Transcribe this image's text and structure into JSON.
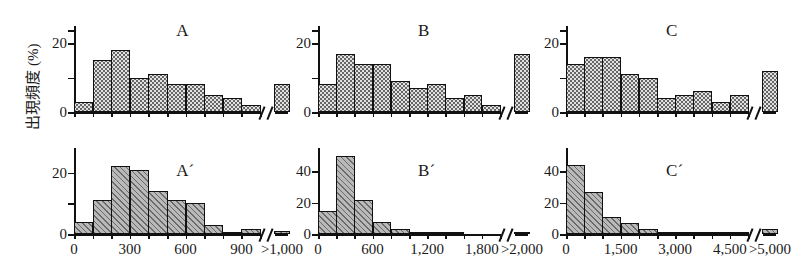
{
  "figure": {
    "ylabel": "出現頻度 (%)",
    "break_symbol": "//"
  },
  "chart_data": [
    {
      "type": "bar",
      "title": "A",
      "panel_id": "A",
      "xlabel": "",
      "ylabel": "出現頻度 (%)",
      "ylim": [
        0,
        25
      ],
      "yticks": [
        0,
        10,
        20
      ],
      "ytick_labels": [
        "0",
        "",
        "20"
      ],
      "xticks": [
        0,
        300,
        600,
        900
      ],
      "xtick_labels": [
        "0",
        "300",
        "600",
        "900"
      ],
      "overflow_label": ">1,000",
      "grid": false,
      "axis_break": true,
      "bin_width": 100,
      "categories": [
        "0-100",
        "100-200",
        "200-300",
        "300-400",
        "400-500",
        "500-600",
        "600-700",
        "700-800",
        "800-900",
        "900-1000",
        ">1,000"
      ],
      "values": [
        3,
        15,
        18,
        10,
        11,
        8,
        8,
        5,
        4,
        2,
        8
      ]
    },
    {
      "type": "bar",
      "title": "A´",
      "panel_id": "A-prime",
      "xlabel": "",
      "ylabel": "出現頻度 (%)",
      "ylim": [
        0,
        28
      ],
      "yticks": [
        0,
        10,
        20
      ],
      "ytick_labels": [
        "0",
        "",
        "20"
      ],
      "xticks": [
        0,
        300,
        600,
        900
      ],
      "xtick_labels": [
        "0",
        "300",
        "600",
        "900"
      ],
      "overflow_label": ">1,000",
      "grid": false,
      "axis_break": true,
      "bin_width": 100,
      "categories": [
        "0-100",
        "100-200",
        "200-300",
        "300-400",
        "400-500",
        "500-600",
        "600-700",
        "700-800",
        "800-900",
        "900-1000",
        ">1,000"
      ],
      "values": [
        4,
        11,
        22,
        21,
        14,
        11,
        10,
        3,
        0.5,
        1.5,
        1
      ]
    },
    {
      "type": "bar",
      "title": "B",
      "panel_id": "B",
      "xlabel": "",
      "ylabel": "出現頻度 (%)",
      "ylim": [
        0,
        25
      ],
      "yticks": [
        0,
        10,
        20
      ],
      "ytick_labels": [
        "0",
        "",
        "20"
      ],
      "xticks": [
        0,
        600,
        1200,
        1800
      ],
      "xtick_labels": [
        "0",
        "600",
        "1,200",
        "1,800"
      ],
      "overflow_label": ">2,000",
      "grid": false,
      "axis_break": true,
      "bin_width": 200,
      "categories": [
        "0-200",
        "200-400",
        "400-600",
        "600-800",
        "800-1000",
        "1000-1200",
        "1200-1400",
        "1400-1600",
        "1600-1800",
        "1800-2000",
        ">2,000"
      ],
      "values": [
        8,
        17,
        14,
        14,
        9,
        7,
        8,
        4,
        5,
        2,
        17
      ]
    },
    {
      "type": "bar",
      "title": "B´",
      "panel_id": "B-prime",
      "xlabel": "",
      "ylabel": "出現頻度 (%)",
      "ylim": [
        0,
        55
      ],
      "yticks": [
        0,
        20,
        40
      ],
      "ytick_labels": [
        "0",
        "20",
        "40"
      ],
      "xticks": [
        0,
        600,
        1200,
        1800
      ],
      "xtick_labels": [
        "0",
        "600",
        "1,200",
        "1,800"
      ],
      "overflow_label": ">2,000",
      "grid": false,
      "axis_break": true,
      "bin_width": 200,
      "categories": [
        "0-200",
        "200-400",
        "400-600",
        "600-800",
        "800-1000",
        "1000-1200",
        "1200-1400",
        "1400-1600",
        "1600-1800",
        "1800-2000",
        ">2,000"
      ],
      "values": [
        15,
        50,
        22,
        8,
        3,
        1.5,
        1.5,
        0.8,
        0,
        0,
        1
      ]
    },
    {
      "type": "bar",
      "title": "C",
      "panel_id": "C",
      "xlabel": "",
      "ylabel": "出現頻度 (%)",
      "ylim": [
        0,
        25
      ],
      "yticks": [
        0,
        10,
        20
      ],
      "ytick_labels": [
        "0",
        "",
        "20"
      ],
      "xticks": [
        0,
        1500,
        3000,
        4500
      ],
      "xtick_labels": [
        "0",
        "1,500",
        "3,000",
        "4,500"
      ],
      "overflow_label": ">5,000",
      "grid": false,
      "axis_break": true,
      "bin_width": 500,
      "categories": [
        "0-500",
        "500-1000",
        "1000-1500",
        "1500-2000",
        "2000-2500",
        "2500-3000",
        "3000-3500",
        "3500-4000",
        "4000-4500",
        "4500-5000",
        ">5,000"
      ],
      "values": [
        14,
        16,
        16,
        11,
        10,
        4,
        5,
        6,
        3,
        5,
        12
      ]
    },
    {
      "type": "bar",
      "title": "C´",
      "panel_id": "C-prime",
      "xlabel": "",
      "ylabel": "出現頻度 (%)",
      "ylim": [
        0,
        55
      ],
      "yticks": [
        0,
        20,
        40
      ],
      "ytick_labels": [
        "0",
        "20",
        "40"
      ],
      "xticks": [
        0,
        1500,
        3000,
        4500
      ],
      "xtick_labels": [
        "0",
        "1,500",
        "3,000",
        "4,500"
      ],
      "overflow_label": ">5,000",
      "grid": false,
      "axis_break": true,
      "bin_width": 500,
      "categories": [
        "0-500",
        "500-1000",
        "1000-1500",
        "1500-2000",
        "2000-2500",
        "2500-3000",
        "3000-3500",
        "3500-4000",
        "4000-4500",
        "4500-5000",
        ">5,000"
      ],
      "values": [
        44,
        27,
        11,
        7,
        3,
        1.2,
        1,
        1.5,
        1,
        0.6,
        3.5
      ]
    }
  ]
}
